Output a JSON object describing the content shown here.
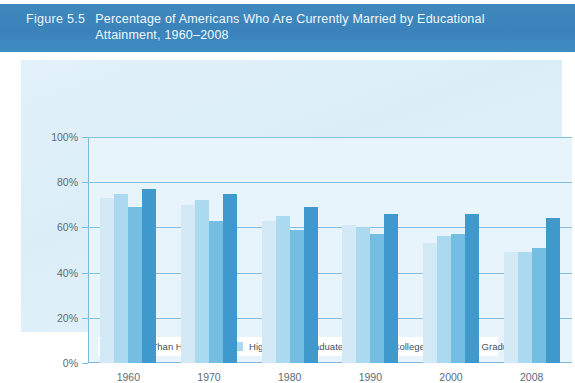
{
  "header": {
    "figure_number": "Figure 5.5",
    "title": "Percentage of Americans Who Are Currently Married by Educational Attainment, 1960–2008",
    "band_color": "#3d87bd"
  },
  "chart_data": {
    "type": "bar",
    "xlabel": "",
    "ylabel": "",
    "ylim": [
      0,
      100
    ],
    "yticks": [
      "0%",
      "20%",
      "40%",
      "60%",
      "80%",
      "100%"
    ],
    "ytick_values": [
      0,
      20,
      40,
      60,
      80,
      100
    ],
    "grid": true,
    "legend_position": "bottom",
    "categories": [
      "1960",
      "1970",
      "1980",
      "1990",
      "2000",
      "2008"
    ],
    "series": [
      {
        "name": "Less Than High School",
        "color": "#d4e9f6",
        "values": [
          73,
          70,
          63,
          61,
          53,
          49
        ]
      },
      {
        "name": "High-School Graduate",
        "color": "#abd9f0",
        "values": [
          75,
          72,
          65,
          60,
          56,
          49
        ]
      },
      {
        "name": "Some College",
        "color": "#74bde3",
        "values": [
          69,
          63,
          59,
          57,
          57,
          51
        ]
      },
      {
        "name": "College Graduate",
        "color": "#4099cd",
        "values": [
          77,
          75,
          69,
          66,
          66,
          64
        ]
      }
    ]
  }
}
